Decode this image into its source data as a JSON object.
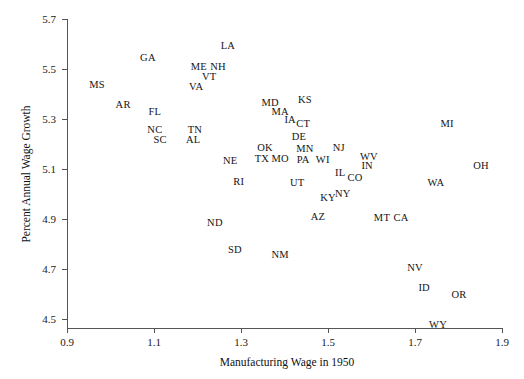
{
  "chart_data": {
    "type": "scatter",
    "title": "",
    "xlabel": "Manufacturing Wage in 1950",
    "ylabel": "Percent Annual Wage Growth",
    "xlim": [
      0.9,
      1.9
    ],
    "ylim": [
      4.5,
      5.7
    ],
    "xticks": [
      "0.9",
      "1.1",
      "1.3",
      "1.5",
      "1.7",
      "1.9"
    ],
    "yticks": [
      "5.7",
      "5.5",
      "5.3",
      "5.1",
      "4.9",
      "4.7",
      "4.5"
    ],
    "grid": false,
    "legend": false,
    "point_style": "text-label",
    "points": [
      {
        "label": "LA",
        "x": 1.27,
        "y": 5.596
      },
      {
        "label": "GA",
        "x": 1.086,
        "y": 5.548
      },
      {
        "label": "ME",
        "x": 1.203,
        "y": 5.512
      },
      {
        "label": "NH",
        "x": 1.247,
        "y": 5.512
      },
      {
        "label": "VT",
        "x": 1.227,
        "y": 5.472
      },
      {
        "label": "MS",
        "x": 0.969,
        "y": 5.44
      },
      {
        "label": "VA",
        "x": 1.197,
        "y": 5.432
      },
      {
        "label": "AR",
        "x": 1.029,
        "y": 5.36
      },
      {
        "label": "MD",
        "x": 1.367,
        "y": 5.368
      },
      {
        "label": "KS",
        "x": 1.447,
        "y": 5.38
      },
      {
        "label": "FL",
        "x": 1.102,
        "y": 5.332
      },
      {
        "label": "MA",
        "x": 1.39,
        "y": 5.332
      },
      {
        "label": "IA",
        "x": 1.413,
        "y": 5.3
      },
      {
        "label": "CT",
        "x": 1.443,
        "y": 5.284
      },
      {
        "label": "NC",
        "x": 1.102,
        "y": 5.26
      },
      {
        "label": "TN",
        "x": 1.194,
        "y": 5.26
      },
      {
        "label": "SC",
        "x": 1.114,
        "y": 5.22
      },
      {
        "label": "AL",
        "x": 1.19,
        "y": 5.22
      },
      {
        "label": "DE",
        "x": 1.433,
        "y": 5.232
      },
      {
        "label": "OK",
        "x": 1.355,
        "y": 5.188
      },
      {
        "label": "MN",
        "x": 1.447,
        "y": 5.184
      },
      {
        "label": "NJ",
        "x": 1.525,
        "y": 5.188
      },
      {
        "label": "WV",
        "x": 1.594,
        "y": 5.152
      },
      {
        "label": "NE",
        "x": 1.275,
        "y": 5.136
      },
      {
        "label": "TX",
        "x": 1.348,
        "y": 5.144
      },
      {
        "label": "MO",
        "x": 1.39,
        "y": 5.144
      },
      {
        "label": "PA",
        "x": 1.443,
        "y": 5.14
      },
      {
        "label": "WI",
        "x": 1.488,
        "y": 5.14
      },
      {
        "label": "IN",
        "x": 1.59,
        "y": 5.116
      },
      {
        "label": "OH",
        "x": 1.852,
        "y": 5.116
      },
      {
        "label": "MI",
        "x": 1.774,
        "y": 5.284
      },
      {
        "label": "RI",
        "x": 1.295,
        "y": 5.052
      },
      {
        "label": "UT",
        "x": 1.429,
        "y": 5.048
      },
      {
        "label": "IL",
        "x": 1.528,
        "y": 5.088
      },
      {
        "label": "CO",
        "x": 1.562,
        "y": 5.068
      },
      {
        "label": "WA",
        "x": 1.748,
        "y": 5.048
      },
      {
        "label": "NY",
        "x": 1.534,
        "y": 5.004
      },
      {
        "label": "KY",
        "x": 1.5,
        "y": 4.988
      },
      {
        "label": "AZ",
        "x": 1.477,
        "y": 4.912
      },
      {
        "label": "MT",
        "x": 1.624,
        "y": 4.908
      },
      {
        "label": "CA",
        "x": 1.668,
        "y": 4.908
      },
      {
        "label": "ND",
        "x": 1.24,
        "y": 4.888
      },
      {
        "label": "SD",
        "x": 1.286,
        "y": 4.78
      },
      {
        "label": "NM",
        "x": 1.39,
        "y": 4.76
      },
      {
        "label": "NV",
        "x": 1.7,
        "y": 4.708
      },
      {
        "label": "ID",
        "x": 1.721,
        "y": 4.628
      },
      {
        "label": "OR",
        "x": 1.801,
        "y": 4.6
      },
      {
        "label": "WY",
        "x": 1.753,
        "y": 4.48
      }
    ]
  }
}
